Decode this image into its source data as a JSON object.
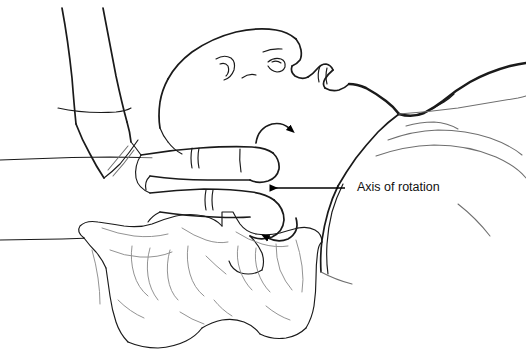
{
  "figure": {
    "title": "Axis of rotation",
    "background_color": "#ffffff",
    "ink_color": "#1a1a1a",
    "shading_color": "#8d8d8d",
    "annotation": {
      "label": "Axis of rotation",
      "label_x": 357,
      "label_y": 188,
      "leader_start_x": 345,
      "leader_end_x": 268,
      "leader_y": 188,
      "arrowhead": "left-pointing-solid-triangle"
    },
    "rotation_arrows": [
      {
        "name": "upper-rotation-arrow",
        "direction": "clockwise-up-right",
        "x": 272,
        "y": 131
      },
      {
        "name": "lower-rotation-arrow",
        "direction": "counterclockwise-left",
        "x": 278,
        "y": 229
      }
    ],
    "elements": [
      {
        "name": "patient-head-profile",
        "label": "Head in profile, supine"
      },
      {
        "name": "clinician-forearm",
        "label": "Clinician forearm"
      },
      {
        "name": "clinician-hand-fingers",
        "label": "Clinician fingers on neck"
      },
      {
        "name": "patient-shoulder-torso",
        "label": "Shoulder and torso"
      },
      {
        "name": "treatment-table-surface",
        "label": "Treatment table surface"
      },
      {
        "name": "cervical-vertebra",
        "label": "Cervical vertebra (atlas) inset"
      }
    ]
  }
}
